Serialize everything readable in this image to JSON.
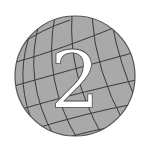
{
  "icon": {
    "name": "globe-number-icon",
    "numeral": "2",
    "colors": {
      "globe_fill": "#a9a9a9",
      "grid_line": "#3a3a3a",
      "outline": "#555555",
      "numeral_fill": "#ffffff",
      "background": "#ffffff"
    }
  }
}
